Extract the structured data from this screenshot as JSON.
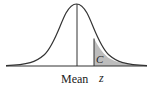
{
  "figure": {
    "type": "normal-distribution-curve",
    "labels": {
      "mean": "Mean",
      "z": "z",
      "shaded_area": "C"
    },
    "colors": {
      "curve": "#333333",
      "shade": "#bdbdbd",
      "axis": "#333333"
    }
  }
}
